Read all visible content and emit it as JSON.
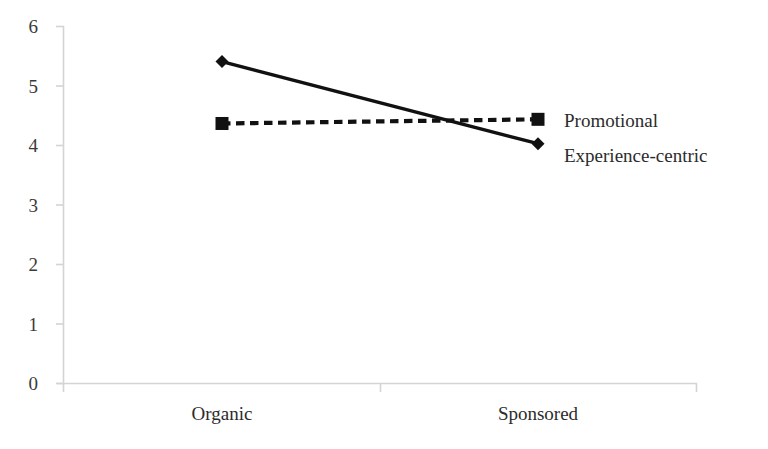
{
  "chart_data": {
    "type": "line",
    "title": "",
    "subtitle": "",
    "xlabel": "",
    "ylabel": "",
    "categories": [
      "Organic",
      "Sponsored"
    ],
    "ylim": [
      0,
      6
    ],
    "yticks": [
      "0",
      "1",
      "2",
      "3",
      "4",
      "5",
      "6"
    ],
    "grid": false,
    "legend_position": "right",
    "series": [
      {
        "name": "Promotional",
        "values": [
          4.37,
          4.44
        ],
        "marker": "square",
        "line_style": "dashed",
        "color": "#111111"
      },
      {
        "name": "Experience-centric",
        "values": [
          5.41,
          4.03
        ],
        "marker": "diamond",
        "line_style": "solid",
        "color": "#111111"
      }
    ]
  },
  "axes": {
    "y_tick_0": "0",
    "y_tick_1": "1",
    "y_tick_2": "2",
    "y_tick_3": "3",
    "y_tick_4": "4",
    "y_tick_5": "5",
    "y_tick_6": "6",
    "x_tick_0": "Organic",
    "x_tick_1": "Sponsored",
    "axis_color": "#d4d4d4"
  },
  "legend": {
    "entry_0": "Promotional",
    "entry_1": "Experience-centric"
  }
}
